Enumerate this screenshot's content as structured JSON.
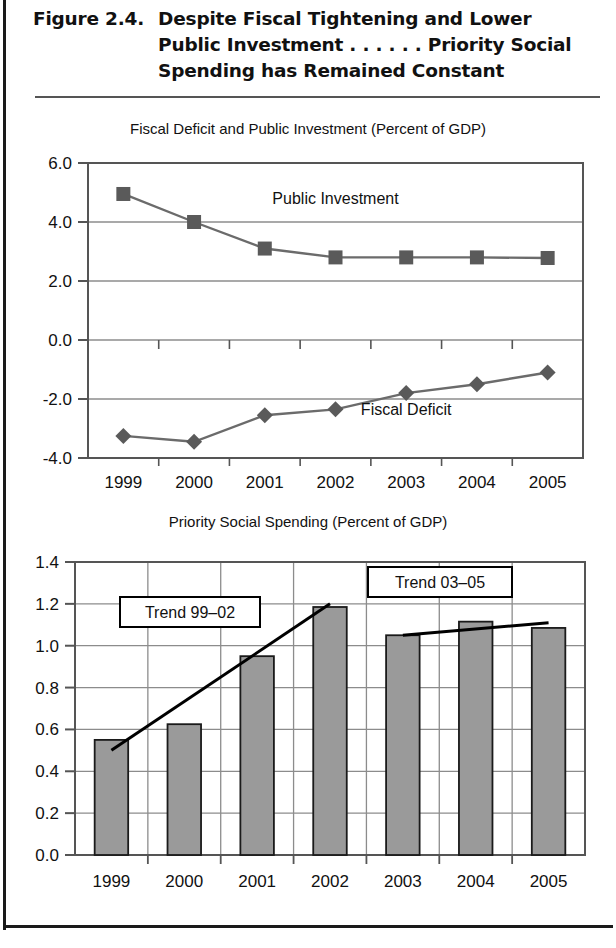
{
  "figure": {
    "number": "Figure 2.4.",
    "title": "Despite Fiscal Tightening and Lower Public Investment . . . . . . Priority Social Spending has Remained Constant",
    "title_line1": "Despite Fiscal Tightening and Lower",
    "title_line2": "Public Investment . . . . . . Priority Social",
    "title_line3": "Spending has Remained Constant"
  },
  "colors": {
    "line_series": "#6b6b6b",
    "marker": "#5a5a5a",
    "bar_fill": "#9a9a9a",
    "bar_stroke": "#1a1a1a",
    "trend_line": "#000000",
    "grid": "#8c8c8c",
    "frame": "#555555",
    "text": "#111111"
  },
  "chart_data": [
    {
      "id": "fiscal-deficit-public-investment",
      "type": "line",
      "title": "Fiscal Deficit and Public Investment (Percent of GDP)",
      "xlabel": "",
      "ylabel": "",
      "ylim": [
        -4.0,
        6.0
      ],
      "ytick_labels": [
        "6.0",
        "4.0",
        "2.0",
        "0.0",
        "-2.0",
        "-4.0"
      ],
      "ytick_values": [
        6.0,
        4.0,
        2.0,
        0.0,
        -2.0,
        -4.0
      ],
      "grid": true,
      "legend_position": "inline-annotation",
      "categories": [
        "1999",
        "2000",
        "2001",
        "2002",
        "2003",
        "2004",
        "2005"
      ],
      "series": [
        {
          "name": "Public Investment",
          "marker": "square",
          "label_x": 2002,
          "label_y": 4.6,
          "values": [
            4.95,
            4.0,
            3.1,
            2.8,
            2.8,
            2.8,
            2.78
          ]
        },
        {
          "name": "Fiscal Deficit",
          "marker": "diamond",
          "label_x": 2003,
          "label_y": -2.55,
          "values": [
            -3.25,
            -3.45,
            -2.55,
            -2.35,
            -1.8,
            -1.5,
            -1.1
          ]
        }
      ]
    },
    {
      "id": "priority-social-spending",
      "type": "bar",
      "title": "Priority Social Spending (Percent of GDP)",
      "xlabel": "",
      "ylabel": "",
      "ylim": [
        0.0,
        1.4
      ],
      "ytick_labels": [
        "1.4",
        "1.2",
        "1.0",
        "0.8",
        "0.6",
        "0.4",
        "0.2",
        "0.0"
      ],
      "ytick_values": [
        1.4,
        1.2,
        1.0,
        0.8,
        0.6,
        0.4,
        0.2,
        0.0
      ],
      "grid": true,
      "categories": [
        "1999",
        "2000",
        "2001",
        "2002",
        "2003",
        "2004",
        "2005"
      ],
      "values": [
        0.55,
        0.625,
        0.95,
        1.185,
        1.05,
        1.115,
        1.085
      ],
      "annotations": [
        {
          "name": "Trend 99–02",
          "label": "Trend 99–02",
          "boxed": true,
          "span": [
            "1999",
            "2002"
          ],
          "from": {
            "x": "1999",
            "y": 0.5
          },
          "to": {
            "x": "2002",
            "y": 1.2
          }
        },
        {
          "name": "Trend 03–05",
          "label": "Trend 03–05",
          "boxed": true,
          "span": [
            "2003",
            "2005"
          ],
          "from": {
            "x": "2003",
            "y": 1.05
          },
          "to": {
            "x": "2005",
            "y": 1.11
          }
        }
      ]
    }
  ]
}
